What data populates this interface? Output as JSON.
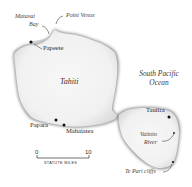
{
  "map": {
    "islands": [
      {
        "name": "Tahiti",
        "label": "Tahiti"
      }
    ],
    "ocean": {
      "line1": "South Pacific",
      "line2": "Ocean"
    },
    "places": [
      {
        "id": "papeete",
        "label": "Papeete",
        "marker": "dot"
      },
      {
        "id": "papara",
        "label": "Papara",
        "marker": "dot"
      },
      {
        "id": "mahaiatea",
        "label": "Mahaiatea",
        "marker": "dot"
      },
      {
        "id": "tautira",
        "label": "Tautira",
        "marker": "dot"
      }
    ],
    "features": [
      {
        "id": "matavai-bay",
        "line1": "Matavai",
        "line2": "Bay"
      },
      {
        "id": "point-venus",
        "label": "Point Venus"
      },
      {
        "id": "vaitoto-river",
        "line1": "Vaitoto",
        "line2": "River"
      },
      {
        "id": "te-pari-cliffs",
        "label": "Te Pari cliffs"
      }
    ],
    "scale": {
      "start": "0",
      "end": "10",
      "unit": "STATUTE MILES"
    },
    "colors": {
      "land": "#f4f4f4",
      "coast_shadow": "#9a9a9a",
      "marker": "#111111",
      "background": "#ffffff"
    }
  }
}
